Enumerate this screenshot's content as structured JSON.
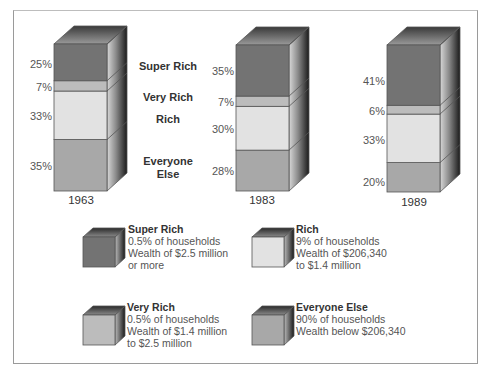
{
  "chart_data": {
    "type": "bar",
    "subtype": "stacked-3d-100pct",
    "title": "",
    "xlabel": "",
    "ylabel": "",
    "categories": [
      "1963",
      "1983",
      "1989"
    ],
    "series": [
      {
        "name": "Everyone Else",
        "values": [
          35,
          28,
          20
        ],
        "color": "#a8a8a8"
      },
      {
        "name": "Rich",
        "values": [
          33,
          30,
          33
        ],
        "color": "#e2e2e2"
      },
      {
        "name": "Very Rich",
        "values": [
          7,
          7,
          6
        ],
        "color": "#bcbcbc"
      },
      {
        "name": "Super Rich",
        "values": [
          25,
          35,
          41
        ],
        "color": "#737373"
      }
    ],
    "ylim": [
      0,
      100
    ],
    "grid": false,
    "legend_position": "bottom",
    "segment_labels": [
      "Super Rich",
      "Very Rich",
      "Rich",
      "Everyone Else"
    ]
  },
  "bars": [
    {
      "year": "1963",
      "labels": {
        "super": "25%",
        "very": "7%",
        "rich": "33%",
        "else": "35%"
      }
    },
    {
      "year": "1983",
      "labels": {
        "super": "35%",
        "very": "7%",
        "rich": "30%",
        "else": "28%"
      }
    },
    {
      "year": "1989",
      "labels": {
        "super": "41%",
        "very": "6%",
        "rich": "33%",
        "else": "20%"
      }
    }
  ],
  "segment_labels": {
    "super": "Super Rich",
    "very": "Very Rich",
    "rich": "Rich",
    "else_line1": "Everyone",
    "else_line2": "Else"
  },
  "legend": [
    {
      "title": "Super Rich",
      "lines": [
        "0.5% of households",
        "Wealth of $2.5 million",
        "or more"
      ],
      "color": "#737373"
    },
    {
      "title": "Rich",
      "lines": [
        "9% of households",
        "Wealth of $206,340",
        "to $1.4 million"
      ],
      "color": "#e2e2e2"
    },
    {
      "title": "Very Rich",
      "lines": [
        "0.5% of households",
        "Wealth of $1.4 million",
        "to $2.5 million"
      ],
      "color": "#bcbcbc"
    },
    {
      "title": "Everyone Else",
      "lines": [
        "90% of households",
        "Wealth below $206,340"
      ],
      "color": "#a8a8a8"
    }
  ]
}
